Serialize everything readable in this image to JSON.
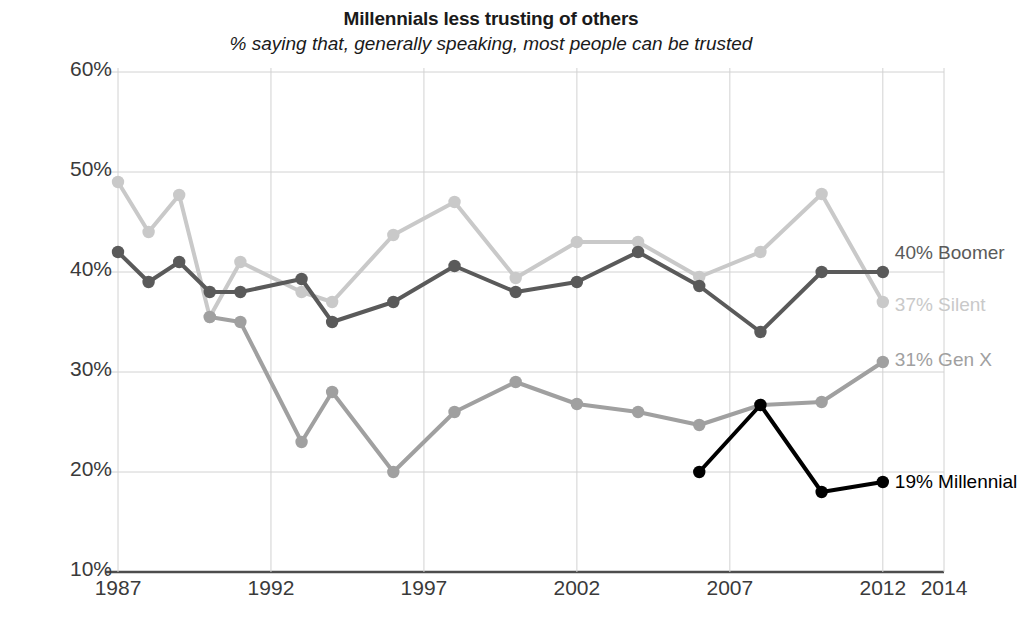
{
  "chart_data": {
    "type": "line",
    "title": "Millennials less trusting of others",
    "subtitle": "% saying that, generally speaking, most people can be trusted",
    "xlabel": "",
    "ylabel": "",
    "xlim": [
      1986,
      2014.6
    ],
    "ylim": [
      10,
      60
    ],
    "grid": true,
    "legend_position": "right-end-labels",
    "y_ticks": [
      "10%",
      "20%",
      "30%",
      "40%",
      "50%",
      "60%"
    ],
    "y_tick_values": [
      10,
      20,
      30,
      40,
      50,
      60
    ],
    "x_ticks": [
      "1987",
      "1992",
      "1997",
      "2002",
      "2007",
      "2012",
      "2014"
    ],
    "x_tick_values": [
      1987,
      1992,
      1997,
      2002,
      2007,
      2012,
      2014
    ],
    "series": [
      {
        "name": "Silent",
        "end_label": "37% Silent",
        "end_value": 37,
        "color": "#c9c9c9",
        "points": [
          [
            1987,
            49
          ],
          [
            1988,
            44
          ],
          [
            1989,
            47.7
          ],
          [
            1990,
            35.5
          ],
          [
            1991,
            41
          ],
          [
            1993,
            38
          ],
          [
            1994,
            37
          ],
          [
            1996,
            43.7
          ],
          [
            1998,
            47
          ],
          [
            2000,
            39.4
          ],
          [
            2002,
            43
          ],
          [
            2004,
            43
          ],
          [
            2006,
            39.5
          ],
          [
            2008,
            42
          ],
          [
            2010,
            47.8
          ],
          [
            2012,
            37
          ]
        ]
      },
      {
        "name": "Boomer",
        "end_label": "40% Boomer",
        "end_value": 40,
        "color": "#5a5a5a",
        "points": [
          [
            1987,
            42
          ],
          [
            1988,
            39
          ],
          [
            1989,
            41
          ],
          [
            1990,
            38
          ],
          [
            1991,
            38
          ],
          [
            1993,
            39.3
          ],
          [
            1994,
            35
          ],
          [
            1996,
            37
          ],
          [
            1998,
            40.6
          ],
          [
            2000,
            38
          ],
          [
            2002,
            39
          ],
          [
            2004,
            42
          ],
          [
            2006,
            38.6
          ],
          [
            2008,
            34
          ],
          [
            2010,
            40
          ],
          [
            2012,
            40
          ]
        ]
      },
      {
        "name": "Gen X",
        "end_label": "31% Gen X",
        "end_value": 31,
        "color": "#a0a0a0",
        "points": [
          [
            1990,
            35.5
          ],
          [
            1991,
            35
          ],
          [
            1993,
            23
          ],
          [
            1994,
            28
          ],
          [
            1996,
            20
          ],
          [
            1998,
            26
          ],
          [
            2000,
            29
          ],
          [
            2002,
            26.8
          ],
          [
            2004,
            26
          ],
          [
            2006,
            24.7
          ],
          [
            2008,
            26.7
          ],
          [
            2010,
            27
          ],
          [
            2012,
            31
          ]
        ]
      },
      {
        "name": "Millennial",
        "end_label": "19% Millennial",
        "end_value": 19,
        "color": "#000000",
        "points": [
          [
            2006,
            20
          ],
          [
            2008,
            26.7
          ],
          [
            2010,
            18
          ],
          [
            2012,
            19
          ]
        ]
      }
    ]
  }
}
